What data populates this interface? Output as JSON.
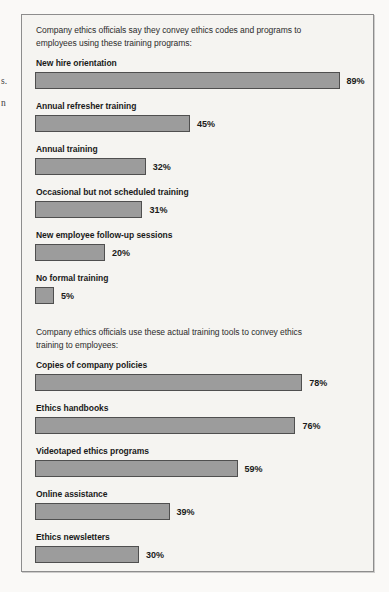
{
  "margin_fragments": [
    {
      "text": "s."
    },
    {
      "text": "n"
    }
  ],
  "chart_data": [
    {
      "type": "bar",
      "orientation": "horizontal",
      "title": "Company ethics officials say they convey ethics codes and programs to employees using these training programs:",
      "title_lines": [
        "Company ethics officials say they convey ethics codes and programs to",
        "employees using these training programs:"
      ],
      "categories": [
        "New hire orientation",
        "Annual refresher training",
        "Annual training",
        "Occasional but not scheduled training",
        "New employee follow-up sessions",
        "No formal training"
      ],
      "values": [
        89,
        45,
        32,
        31,
        20,
        5
      ],
      "value_labels": [
        "89%",
        "45%",
        "32%",
        "31%",
        "20%",
        "5%"
      ],
      "unit": "%",
      "xlim": [
        0,
        100
      ],
      "grid": false,
      "legend": false
    },
    {
      "type": "bar",
      "orientation": "horizontal",
      "title": "Company ethics officials use these actual training tools to convey ethics training to employees:",
      "title_lines": [
        "Company ethics officials use these actual training tools to convey ethics",
        "training to employees:"
      ],
      "categories": [
        "Copies of company policies",
        "Ethics handbooks",
        "Videotaped ethics programs",
        "Online assistance",
        "Ethics newsletters"
      ],
      "values": [
        78,
        76,
        59,
        39,
        30
      ],
      "value_labels": [
        "78%",
        "76%",
        "59%",
        "39%",
        "30%"
      ],
      "unit": "%",
      "xlim": [
        0,
        100
      ],
      "grid": false,
      "legend": false
    }
  ],
  "colors": {
    "page_background": "#faf9f7",
    "panel_background": "#f5f4f1",
    "panel_border": "#8d8d8d",
    "bar_fill": "#9c9c9c",
    "bar_border": "#4f4f4f",
    "text": "#1a1a1a"
  }
}
